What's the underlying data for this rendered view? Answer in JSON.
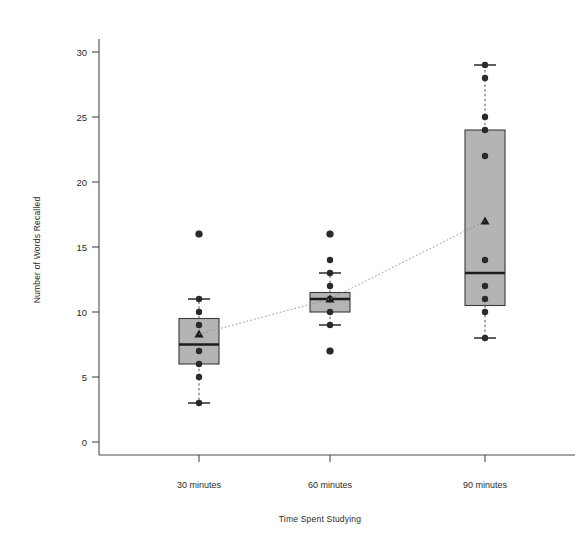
{
  "chart_data": {
    "type": "box",
    "title": "",
    "xlabel": "Time Spent Studying",
    "ylabel": "Number of Words Recalled",
    "categories": [
      "30 minutes",
      "60 minutes",
      "90 minutes"
    ],
    "ylim": [
      0,
      31
    ],
    "yticks": [
      0,
      5,
      10,
      15,
      20,
      25,
      30
    ],
    "ytick_labels": [
      "0",
      "5",
      "10",
      "15",
      "20",
      "25",
      "30"
    ],
    "grid": false,
    "legend": "none",
    "annotations": [
      "dotted line connects group means across categories"
    ],
    "series": [
      {
        "name": "30 minutes",
        "whisker_low": 3,
        "q1": 6,
        "median": 7.5,
        "q3": 9.5,
        "whisker_high": 11,
        "mean": 8.3,
        "outliers": [
          16
        ],
        "points": [
          3,
          5,
          6,
          7,
          9,
          10,
          11,
          16
        ]
      },
      {
        "name": "60 minutes",
        "whisker_low": 9,
        "q1": 10,
        "median": 11,
        "q3": 11.5,
        "whisker_high": 13,
        "mean": 11.0,
        "outliers": [
          7,
          16
        ],
        "points": [
          7,
          9,
          10,
          11,
          12,
          13,
          14,
          16
        ]
      },
      {
        "name": "90 minutes",
        "whisker_low": 8,
        "q1": 10.5,
        "median": 13,
        "q3": 24,
        "whisker_high": 29,
        "mean": 17.0,
        "outliers": [],
        "points": [
          8,
          10,
          11,
          12,
          14,
          22,
          24,
          25,
          28,
          29
        ]
      }
    ],
    "colors": {
      "box_fill": "#b4b4b4",
      "box_stroke": "#3a3a3a",
      "median": "#1c1c1c",
      "point": "#2a2a2a",
      "trend": "#8a8a8a",
      "axis": "#4a4a4a",
      "background": "#ffffff"
    }
  },
  "axis": {
    "x_title": "Time Spent Studying",
    "y_title": "Number of Words Recalled"
  }
}
